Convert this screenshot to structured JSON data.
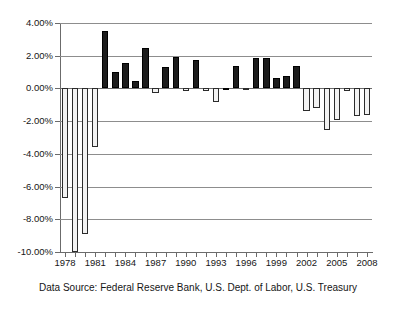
{
  "chart_data": {
    "type": "bar",
    "title": "",
    "xlabel": "",
    "ylabel": "",
    "ylim": [
      -10,
      4
    ],
    "ytick_step": 2,
    "grid": true,
    "legend": false,
    "caption": "Data Source: Federal Reserve Bank, U.S. Dept. of Labor, U.S. Treasury",
    "y_tick_labels": [
      "4.00%",
      "2.00%",
      "0.00%",
      "-2.00%",
      "-4.00%",
      "-6.00%",
      "-8.00%",
      "-10.00%"
    ],
    "y_tick_values": [
      4,
      2,
      0,
      -2,
      -4,
      -6,
      -8,
      -10
    ],
    "x_tick_labels": [
      "1978",
      "1981",
      "1984",
      "1987",
      "1990",
      "1993",
      "1996",
      "1999",
      "2002",
      "2005",
      "2008"
    ],
    "x_label_values": [
      1978,
      1981,
      1984,
      1987,
      1990,
      1993,
      1996,
      1999,
      2002,
      2005,
      2008
    ],
    "categories": [
      1978,
      1979,
      1980,
      1981,
      1982,
      1983,
      1984,
      1985,
      1986,
      1987,
      1988,
      1989,
      1990,
      1991,
      1992,
      1993,
      1994,
      1995,
      1996,
      1997,
      1998,
      1999,
      2000,
      2001,
      2002,
      2003,
      2004,
      2005,
      2006,
      2007,
      2008
    ],
    "values": [
      -6.7,
      -10.0,
      -8.9,
      -3.6,
      3.5,
      1.0,
      1.55,
      0.45,
      2.5,
      -0.3,
      1.3,
      1.95,
      -0.15,
      1.75,
      -0.15,
      -0.85,
      0.05,
      1.35,
      -0.1,
      1.85,
      1.85,
      0.65,
      0.75,
      1.35,
      -1.35,
      -1.2,
      -2.55,
      -1.9,
      -0.15,
      -1.7,
      -1.65
    ],
    "series_name": "Annual rate",
    "positive_bar_color": "#1c1c1c",
    "negative_bar_color": "#f2f2f2",
    "bar_border_color": "#2b2b2b",
    "axis_color": "#6b6b6b",
    "gridline_color": "#8d8d8d"
  }
}
